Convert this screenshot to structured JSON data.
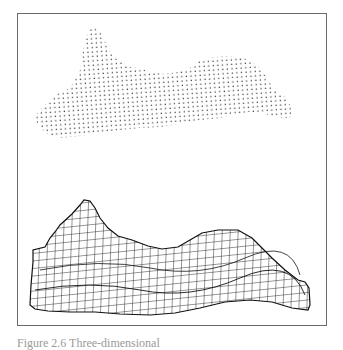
{
  "figure": {
    "panels": [
      {
        "name": "point-cloud",
        "description": "scattered 3D sample points of surface"
      },
      {
        "name": "wireframe-mesh",
        "description": "reconstructed wireframe surface mesh"
      }
    ],
    "colors": {
      "ink": "#1a1a1a",
      "frame": "#6a6a6a",
      "background": "#ffffff"
    }
  },
  "caption": {
    "text": "Figure 2.6  Three-dimensional"
  }
}
